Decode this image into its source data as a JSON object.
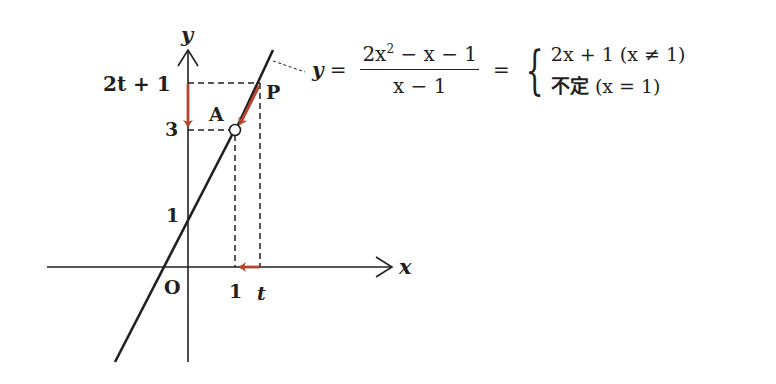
{
  "colors": {
    "ink": "#231f20",
    "accent_arrow": "#b5452c",
    "background": "#ffffff"
  },
  "axes": {
    "x_label": "x",
    "y_label": "y",
    "origin_label": "O"
  },
  "ticks": {
    "x": [
      {
        "label": "1",
        "value": "1"
      },
      {
        "label": "t",
        "value": "t"
      }
    ],
    "y": [
      {
        "label": "1",
        "value": "1"
      },
      {
        "label": "3",
        "value": "3"
      },
      {
        "label": "2t + 1",
        "value": "2t+1"
      }
    ]
  },
  "points": {
    "A": {
      "label": "A",
      "coords": "(1, 3)",
      "style": "open-circle"
    },
    "P": {
      "label": "P",
      "coords": "(t, 2t+1)",
      "style": "point-on-line"
    }
  },
  "graph_line": {
    "equation": "y = 2x + 1",
    "y_intercept": "1",
    "hole_at": "x = 1"
  },
  "arrows": [
    {
      "name": "y-value-arrow",
      "from": "2t+1",
      "to": "3",
      "axis": "y"
    },
    {
      "name": "point-arrow",
      "from": "P",
      "to": "A",
      "along": "line"
    },
    {
      "name": "x-value-arrow",
      "from": "t",
      "to": "1",
      "axis": "x"
    }
  ],
  "formula": {
    "lhs": "y",
    "eq1": "=",
    "numerator_a": "2x",
    "numerator_exp": "2",
    "numerator_b": " − x − 1",
    "denominator": "x − 1",
    "eq2": "=",
    "case1_expr": "2x + 1",
    "case1_cond": "(x ≠ 1)",
    "case2_expr": "不定",
    "case2_cond": "(x = 1)"
  }
}
